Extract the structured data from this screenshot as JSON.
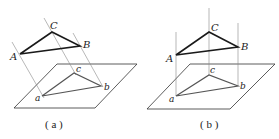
{
  "figures": [
    {
      "id": "a",
      "caption": "( a )",
      "labels": {
        "A": "A",
        "B": "B",
        "C": "C",
        "a": "a",
        "b": "b",
        "c": "c"
      },
      "projection": "oblique"
    },
    {
      "id": "b",
      "caption": "( b )",
      "labels": {
        "A": "A",
        "B": "B",
        "C": "C",
        "a": "a",
        "b": "b",
        "c": "c"
      },
      "projection": "orthogonal"
    }
  ],
  "colors": {
    "triangle": "#1a1a1a",
    "projection": "#555555",
    "plane": "#333333",
    "lines": "#777777"
  }
}
